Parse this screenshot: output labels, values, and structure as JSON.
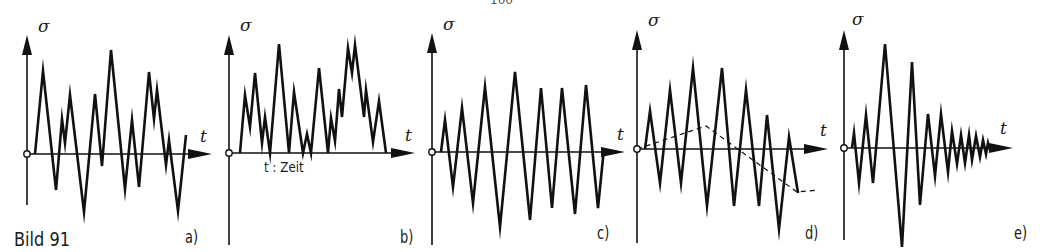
{
  "figure": {
    "caption": "Bild 91",
    "page_number_partial": "100",
    "time_note": "t : Zeit",
    "ink_color": "#111111",
    "axis_y_label": "σ",
    "axis_x_label": "t"
  },
  "panels": [
    {
      "id": "a",
      "label": "a)",
      "description": "random irregular stress-time sequence about zero mean",
      "origin": [
        27,
        154
      ],
      "y_axis": {
        "top": 35,
        "bottom": 205
      },
      "x_axis": {
        "end": 212
      },
      "y_label_pos": [
        38,
        35
      ],
      "t_label_pos": [
        198,
        130
      ],
      "panel_label_pos": [
        185,
        225
      ],
      "path": [
        [
          35,
          154
        ],
        [
          43,
          71
        ],
        [
          56,
          190
        ],
        [
          62,
          119
        ],
        [
          65,
          143
        ],
        [
          70,
          95
        ],
        [
          84,
          212
        ],
        [
          95,
          94
        ],
        [
          102,
          166
        ],
        [
          111,
          50
        ],
        [
          125,
          189
        ],
        [
          132,
          120
        ],
        [
          139,
          187
        ],
        [
          149,
          72
        ],
        [
          154,
          119
        ],
        [
          157,
          90
        ],
        [
          166,
          165
        ],
        [
          169,
          140
        ],
        [
          178,
          211
        ],
        [
          186,
          135
        ]
      ]
    },
    {
      "id": "b",
      "label": "b)",
      "description": "stress sequence with non-zero (positive) mean, pulsating",
      "origin": [
        229,
        153
      ],
      "y_axis": {
        "top": 35,
        "bottom": 245
      },
      "x_axis": {
        "end": 415
      },
      "y_label_pos": [
        240,
        32
      ],
      "t_label_pos": [
        405,
        130
      ],
      "panel_label_pos": [
        400,
        225
      ],
      "time_note_pos": [
        264,
        167
      ],
      "path": [
        [
          240,
          153
        ],
        [
          245,
          95
        ],
        [
          250,
          127
        ],
        [
          255,
          73
        ],
        [
          262,
          143
        ],
        [
          265,
          117
        ],
        [
          270,
          153
        ],
        [
          279,
          44
        ],
        [
          289,
          153
        ],
        [
          294,
          92
        ],
        [
          303,
          153
        ],
        [
          307,
          134
        ],
        [
          311,
          153
        ],
        [
          319,
          68
        ],
        [
          328,
          153
        ],
        [
          331,
          118
        ],
        [
          335,
          141
        ],
        [
          339,
          89
        ],
        [
          342,
          117
        ],
        [
          348,
          48
        ],
        [
          352,
          73
        ],
        [
          355,
          45
        ],
        [
          364,
          117
        ],
        [
          366,
          90
        ],
        [
          373,
          142
        ],
        [
          379,
          101
        ],
        [
          386,
          153
        ]
      ]
    },
    {
      "id": "c",
      "label": "c)",
      "description": "cyclic stress with gradually increasing then constant amplitude, zero mean",
      "origin": [
        432,
        152
      ],
      "y_axis": {
        "top": 33,
        "bottom": 245
      },
      "x_axis": {
        "end": 625
      },
      "y_label_pos": [
        443,
        30
      ],
      "t_label_pos": [
        615,
        130
      ],
      "panel_label_pos": [
        597,
        225
      ],
      "path": [
        [
          441,
          152
        ],
        [
          445,
          120
        ],
        [
          453,
          187
        ],
        [
          462,
          108
        ],
        [
          473,
          203
        ],
        [
          485,
          87
        ],
        [
          500,
          227
        ],
        [
          515,
          72
        ],
        [
          530,
          220
        ],
        [
          541,
          88
        ],
        [
          552,
          208
        ],
        [
          562,
          88
        ],
        [
          575,
          214
        ],
        [
          586,
          85
        ],
        [
          598,
          208
        ],
        [
          604,
          148
        ]
      ]
    },
    {
      "id": "d",
      "label": "d)",
      "description": "cyclic stress superimposed on slowly varying mean stress (dashed)",
      "origin": [
        637,
        149
      ],
      "y_axis": {
        "top": 30,
        "bottom": 243
      },
      "x_axis": {
        "end": 828
      },
      "y_label_pos": [
        648,
        26
      ],
      "t_label_pos": [
        818,
        125
      ],
      "panel_label_pos": [
        805,
        225
      ],
      "path": [
        [
          645,
          149
        ],
        [
          650,
          111
        ],
        [
          660,
          183
        ],
        [
          670,
          90
        ],
        [
          681,
          183
        ],
        [
          693,
          68
        ],
        [
          707,
          206
        ],
        [
          722,
          68
        ],
        [
          734,
          206
        ],
        [
          746,
          90
        ],
        [
          759,
          206
        ],
        [
          767,
          115
        ],
        [
          779,
          229
        ],
        [
          789,
          137
        ],
        [
          798,
          193
        ]
      ],
      "mean_path": [
        [
          637,
          149
        ],
        [
          706,
          126
        ],
        [
          797,
          192
        ],
        [
          818,
          190
        ]
      ]
    },
    {
      "id": "e",
      "label": "e)",
      "description": "transient/shock stress with decaying oscillation",
      "origin": [
        844,
        148
      ],
      "y_axis": {
        "top": 30,
        "bottom": 240
      },
      "x_axis": {
        "end": 1013
      },
      "y_label_pos": [
        855,
        25
      ],
      "t_label_pos": [
        1002,
        125
      ],
      "panel_label_pos": [
        1014,
        225
      ],
      "path": [
        [
          852,
          148
        ],
        [
          854,
          133
        ],
        [
          859,
          183
        ],
        [
          866,
          115
        ],
        [
          873,
          183
        ],
        [
          885,
          44
        ],
        [
          902,
          247
        ],
        [
          912,
          62
        ],
        [
          920,
          205
        ],
        [
          928,
          114
        ],
        [
          935,
          176
        ],
        [
          941,
          114
        ],
        [
          948,
          172
        ],
        [
          952,
          131
        ],
        [
          957,
          164
        ],
        [
          961,
          135
        ],
        [
          965,
          163
        ],
        [
          969,
          135
        ],
        [
          972,
          160
        ],
        [
          976,
          136
        ],
        [
          980,
          157
        ],
        [
          983,
          140
        ],
        [
          986,
          154
        ],
        [
          988,
          143
        ],
        [
          990,
          150
        ]
      ]
    }
  ]
}
